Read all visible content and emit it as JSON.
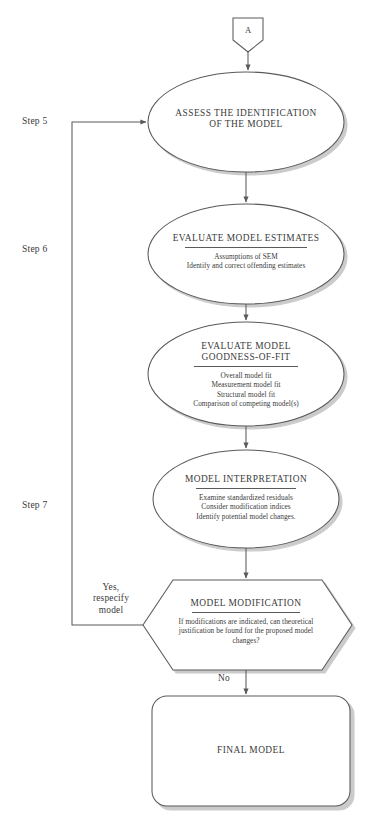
{
  "diagram": {
    "stroke_color": "#5a5a5a",
    "shadow_color": "#c9c9c9",
    "text_color": "#3a3a3a",
    "background": "#ffffff"
  },
  "connector": {
    "label": "A",
    "shape": "shield-pentagon"
  },
  "steps": [
    {
      "id": "step5",
      "label": "Step 5"
    },
    {
      "id": "step6",
      "label": "Step 6"
    },
    {
      "id": "step7",
      "label": "Step 7"
    }
  ],
  "nodes": [
    {
      "id": "assess-identification",
      "shape": "ellipse",
      "title": "ASSESS THE IDENTIFICATION OF THE MODEL",
      "title_lines": [
        "ASSESS THE IDENTIFICATION",
        "OF THE MODEL"
      ],
      "has_rule": false,
      "sub_lines": []
    },
    {
      "id": "evaluate-model-estimates",
      "shape": "ellipse",
      "title": "EVALUATE MODEL ESTIMATES",
      "title_lines": [
        "EVALUATE MODEL ESTIMATES"
      ],
      "has_rule": true,
      "sub_lines": [
        "Assumptions of SEM",
        "Identify and correct offending estimates"
      ]
    },
    {
      "id": "evaluate-goodness-of-fit",
      "shape": "ellipse",
      "title": "EVALUATE MODEL GOODNESS-OF-FIT",
      "title_lines": [
        "EVALUATE MODEL",
        "GOODNESS-OF-FIT"
      ],
      "has_rule": true,
      "sub_lines": [
        "Overall model fit",
        "Measurement model fit",
        "Structural model fit",
        "Comparison of competing model(s)"
      ]
    },
    {
      "id": "model-interpretation",
      "shape": "ellipse",
      "title": "MODEL INTERPRETATION",
      "title_lines": [
        "MODEL INTERPRETATION"
      ],
      "has_rule": true,
      "sub_lines": [
        "Examine standardized residuals",
        "Consider modification indices",
        "Identify potential model changes."
      ]
    },
    {
      "id": "model-modification",
      "shape": "hexagon",
      "title": "MODEL MODIFICATION",
      "title_lines": [
        "MODEL MODIFICATION"
      ],
      "has_rule": true,
      "sub_lines": [
        "If modifications are indicated, can theoretical",
        "justification be found for the proposed model",
        "changes?"
      ]
    },
    {
      "id": "final-model",
      "shape": "rounded-rectangle",
      "title": "FINAL MODEL",
      "title_lines": [
        "FINAL MODEL"
      ],
      "has_rule": false,
      "sub_lines": []
    }
  ],
  "edge_labels": {
    "feedback": "Yes,\nrespecify\nmodel",
    "feedback_lines": [
      "Yes,",
      "respecify",
      "model"
    ],
    "no": "No"
  }
}
